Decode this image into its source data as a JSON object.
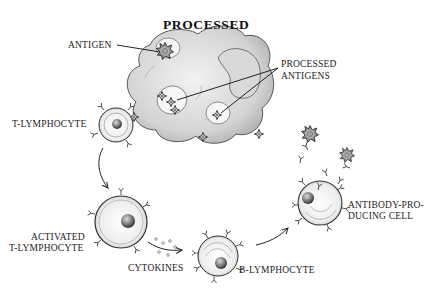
{
  "diagram": {
    "labels": {
      "antigen": "ANTIGEN",
      "processed_antigens_line1": "PROCESSED",
      "processed_antigens_line2": "ANTIGENS",
      "t_lymphocyte": "T-LYMPHOCYTE",
      "activated_line1": "ACTIVATED",
      "activated_line2": "T-LYMPHOCYTE",
      "cytokines": "CYTOKINES",
      "b_lymphocyte": "B-LYMPHOCYTE",
      "antibody_line1": "ANTIBODY-PRO-",
      "antibody_line2": "DUCING CELL"
    },
    "nodes": [
      {
        "id": "macrophage",
        "label": "MACROPHAGE"
      },
      {
        "id": "antigen",
        "label": "ANTIGEN"
      },
      {
        "id": "processed-antigens",
        "label": "PROCESSED ANTIGENS"
      },
      {
        "id": "t-lymphocyte",
        "label": "T-LYMPHOCYTE"
      },
      {
        "id": "activated-t-lymphocyte",
        "label": "ACTIVATED T-LYMPHOCYTE"
      },
      {
        "id": "cytokines",
        "label": "CYTOKINES"
      },
      {
        "id": "b-lymphocyte",
        "label": "B-LYMPHOCYTE"
      },
      {
        "id": "antibody-producing-cell",
        "label": "ANTIBODY-PRODUCING CELL"
      }
    ],
    "edges": [
      {
        "from": "t-lymphocyte",
        "to": "activated-t-lymphocyte"
      },
      {
        "from": "activated-t-lymphocyte",
        "to": "b-lymphocyte",
        "via": "cytokines"
      },
      {
        "from": "b-lymphocyte",
        "to": "antibody-producing-cell"
      }
    ],
    "colors": {
      "ink": "#1a1a1a",
      "stipple": "#bdbdbd",
      "background": "#ffffff"
    }
  }
}
